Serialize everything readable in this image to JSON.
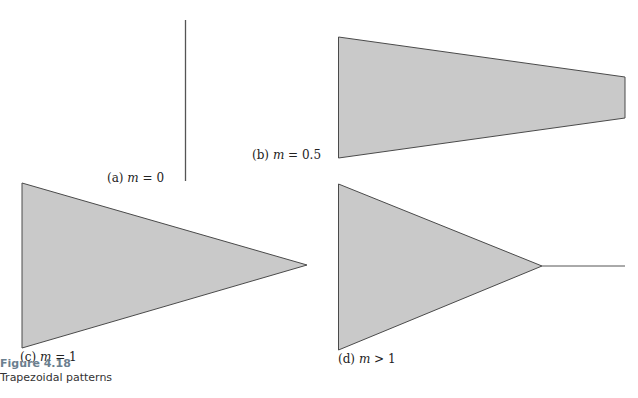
{
  "figure": {
    "number": "Figure 4.18",
    "caption": "Trapezoidal patterns",
    "fill_color": "#c9c9c9",
    "stroke_color": "#4a4a4a"
  },
  "panels": [
    {
      "id": "a",
      "prefix": "(a)",
      "var": "m",
      "relation": "= 0",
      "shape": "vertical line"
    },
    {
      "id": "b",
      "prefix": "(b)",
      "var": "m",
      "relation": "= 0.5",
      "shape": "trapezoid"
    },
    {
      "id": "c",
      "prefix": "(c)",
      "var": "m",
      "relation": "= 1",
      "shape": "triangle"
    },
    {
      "id": "d",
      "prefix": "(d)",
      "var": "m",
      "relation": "> 1",
      "shape": "triangle with tail line"
    }
  ]
}
